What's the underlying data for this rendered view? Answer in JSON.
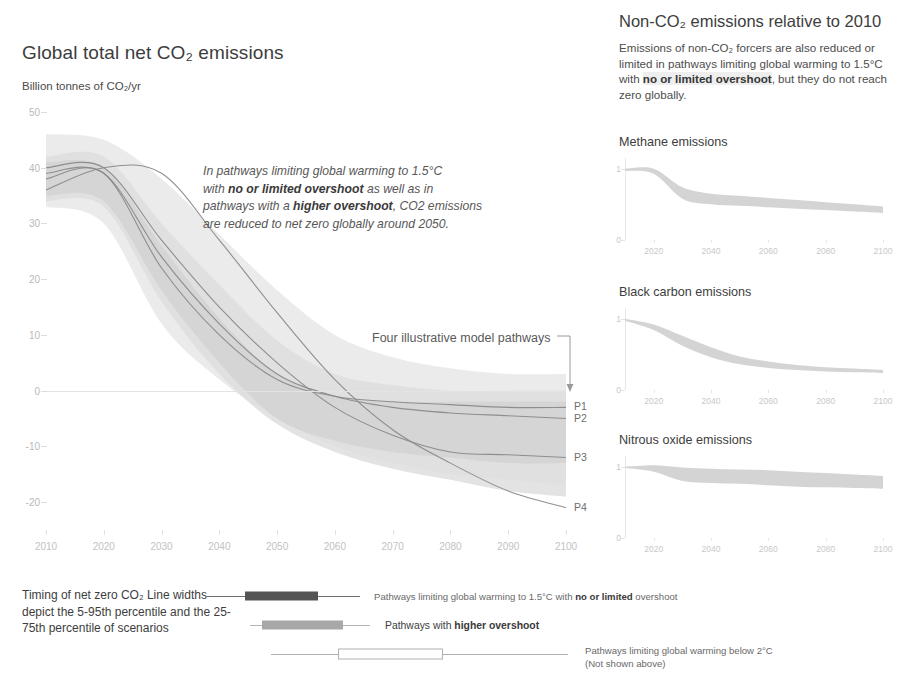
{
  "left": {
    "title": "Global total net CO₂ emissions",
    "axis_unit": "Billion tonnes of CO₂/yr",
    "annotation": {
      "l1a": "In pathways limiting global warming to 1.5°C",
      "l2a": "with ",
      "l2b": "no or limited overshoot",
      "l2c": " as well as in",
      "l3a": "pathways with a ",
      "l3b": "higher overshoot",
      "l3c": ", CO2 emissions",
      "l4a": "are reduced to net zero globally around 2050."
    },
    "pathways_label": "Four illustrative model pathways",
    "pathway_names": [
      "P1",
      "P2",
      "P3",
      "P4"
    ]
  },
  "right": {
    "title": "Non-CO₂ emissions relative to 2010",
    "sub_a": "Emissions of non-CO₂ forcers are also reduced or limited in pathways limiting global warming to 1.5°C with ",
    "sub_b": "no or limited overshoot",
    "sub_c": ", but they do not reach zero globally.",
    "panels": [
      "Methane emissions",
      "Black carbon emissions",
      "Nitrous oxide emissions"
    ]
  },
  "legend": {
    "caption": "Timing of net zero CO₂ Line widths depict the 5-95th percentile and the 25-75th percentile of scenarios",
    "rows": [
      {
        "a": "Pathways limiting global warming to 1.5°C with ",
        "b": "no or limited",
        "c": " overshoot"
      },
      {
        "a": "Pathways with ",
        "b": "higher overshoot",
        "c": ""
      },
      {
        "a": "Pathways limiting global warming below 2°C",
        "b": "",
        "c": ""
      }
    ],
    "row3_note": "(Not shown above)"
  },
  "colors": {
    "band_light": "#d9d9d9",
    "band_mid": "#c4c4c4",
    "line": "#8f8f8f",
    "text": "#3d3d3d",
    "axis": "#c9c9c9"
  },
  "chart_data": [
    {
      "type": "area",
      "id": "global-net-co2",
      "title": "Global total net CO₂ emissions",
      "ylabel": "Billion tonnes of CO₂/yr",
      "xlabel": "",
      "xlim": [
        2010,
        2100
      ],
      "ylim": [
        -25,
        50
      ],
      "yticks": [
        50,
        40,
        30,
        20,
        10,
        0,
        -10,
        -20
      ],
      "xticks": [
        2010,
        2020,
        2030,
        2040,
        2050,
        2060,
        2070,
        2080,
        2090,
        2100
      ],
      "grid": false,
      "legend": "right-inline",
      "x": [
        2010,
        2020,
        2030,
        2040,
        2050,
        2060,
        2070,
        2080,
        2090,
        2100
      ],
      "bands": [
        {
          "name": "below 2°C range (outer)",
          "upper": [
            46,
            45,
            38,
            28,
            18,
            10,
            6,
            4,
            3,
            3
          ],
          "lower": [
            33,
            30,
            12,
            2,
            -5,
            -10,
            -13,
            -15,
            -16,
            -17
          ]
        },
        {
          "name": "1.5°C higher overshoot range",
          "upper": [
            42,
            42,
            30,
            19,
            9,
            3,
            1,
            0,
            0,
            0
          ],
          "lower": [
            34,
            33,
            16,
            3,
            -6,
            -11,
            -14,
            -16,
            -18,
            -19
          ]
        },
        {
          "name": "1.5°C no or limited overshoot range",
          "upper": [
            41,
            40,
            26,
            13,
            3,
            -1,
            -2,
            -2,
            -2,
            -2
          ],
          "lower": [
            35,
            34,
            18,
            5,
            -5,
            -9,
            -11,
            -12,
            -13,
            -13
          ]
        }
      ],
      "series": [
        {
          "name": "P1",
          "values": [
            38,
            39,
            22,
            10,
            2,
            -1,
            -2,
            -2.5,
            -3,
            -3
          ]
        },
        {
          "name": "P2",
          "values": [
            39,
            39,
            24,
            12,
            3,
            -1,
            -3,
            -4,
            -4.5,
            -5
          ]
        },
        {
          "name": "P3",
          "values": [
            40,
            40,
            27,
            15,
            5,
            -3,
            -8,
            -11,
            -11.5,
            -12
          ]
        },
        {
          "name": "P4",
          "values": [
            36,
            40,
            39,
            27,
            14,
            2,
            -7,
            -13,
            -18,
            -21
          ]
        }
      ],
      "net_zero_year": 2050
    },
    {
      "type": "area",
      "id": "methane",
      "title": "Methane emissions",
      "ylabel": "",
      "xlim": [
        2010,
        2100
      ],
      "ylim": [
        0,
        1.15
      ],
      "yticks": [
        0,
        1
      ],
      "xticks": [
        2020,
        2040,
        2060,
        2080,
        2100
      ],
      "grid": false,
      "x": [
        2010,
        2020,
        2030,
        2040,
        2050,
        2060,
        2070,
        2080,
        2090,
        2100
      ],
      "bands": [
        {
          "name": "range",
          "upper": [
            1.0,
            1.0,
            0.74,
            0.65,
            0.62,
            0.59,
            0.56,
            0.53,
            0.5,
            0.47
          ],
          "lower": [
            0.97,
            0.93,
            0.58,
            0.5,
            0.48,
            0.46,
            0.44,
            0.42,
            0.4,
            0.38
          ]
        }
      ]
    },
    {
      "type": "area",
      "id": "black-carbon",
      "title": "Black carbon emissions",
      "ylabel": "",
      "xlim": [
        2010,
        2100
      ],
      "ylim": [
        0,
        1.15
      ],
      "yticks": [
        0,
        1
      ],
      "xticks": [
        2020,
        2040,
        2060,
        2080,
        2100
      ],
      "grid": false,
      "x": [
        2010,
        2020,
        2030,
        2040,
        2050,
        2060,
        2070,
        2080,
        2090,
        2100
      ],
      "bands": [
        {
          "name": "range",
          "upper": [
            1.0,
            0.92,
            0.76,
            0.6,
            0.47,
            0.4,
            0.35,
            0.32,
            0.3,
            0.28
          ],
          "lower": [
            0.97,
            0.84,
            0.62,
            0.46,
            0.36,
            0.31,
            0.28,
            0.26,
            0.25,
            0.24
          ]
        }
      ]
    },
    {
      "type": "area",
      "id": "nitrous-oxide",
      "title": "Nitrous oxide emissions",
      "ylabel": "",
      "xlim": [
        2010,
        2100
      ],
      "ylim": [
        0,
        1.15
      ],
      "yticks": [
        0,
        1
      ],
      "xticks": [
        2020,
        2040,
        2060,
        2080,
        2100
      ],
      "grid": false,
      "x": [
        2010,
        2020,
        2030,
        2040,
        2050,
        2060,
        2070,
        2080,
        2090,
        2100
      ],
      "bands": [
        {
          "name": "range",
          "upper": [
            1.0,
            1.02,
            0.99,
            0.97,
            0.96,
            0.95,
            0.93,
            0.91,
            0.89,
            0.87
          ],
          "lower": [
            0.98,
            0.93,
            0.8,
            0.77,
            0.76,
            0.74,
            0.72,
            0.71,
            0.7,
            0.69
          ]
        }
      ]
    },
    {
      "type": "bar",
      "id": "net-zero-timing",
      "title": "Timing of net zero CO₂",
      "categories": [
        "Pathways limiting global warming to 1.5°C with no or limited overshoot",
        "Pathways with higher overshoot",
        "Pathways limiting global warming below 2°C"
      ],
      "whisker_low": [
        2037,
        2047,
        2050
      ],
      "box_low": [
        2045,
        2052,
        2065
      ],
      "box_high": [
        2055,
        2063,
        2085
      ],
      "whisker_high": [
        2063,
        2067,
        2098
      ],
      "note": "Line widths depict the 5-95th percentile and the 25-75th percentile of scenarios"
    }
  ]
}
